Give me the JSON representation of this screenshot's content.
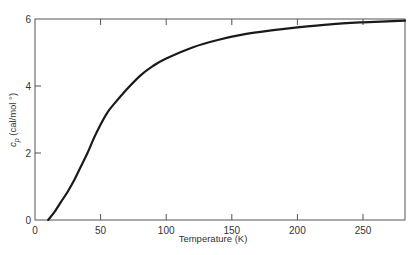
{
  "chart_data": {
    "type": "line",
    "title": "",
    "xlabel": "Temperature (K)",
    "ylabel": "c_p (cal/mol °)",
    "ylabel_main": "c",
    "ylabel_sub": "p",
    "ylabel_rest": " (cal/mol °)",
    "xlim": [
      0,
      282
    ],
    "ylim": [
      0,
      6
    ],
    "xticks": [
      0,
      50,
      100,
      150,
      200,
      250
    ],
    "yticks": [
      0,
      2,
      4,
      6
    ],
    "xtick_labels": [
      "0",
      "50",
      "100",
      "150",
      "200",
      "250"
    ],
    "ytick_labels": [
      "0",
      "2",
      "4",
      "6"
    ],
    "grid": false,
    "legend": null,
    "series": [
      {
        "name": "c_p",
        "x": [
          10,
          15,
          20,
          25,
          30,
          35,
          40,
          45,
          50,
          55,
          60,
          70,
          80,
          90,
          100,
          120,
          140,
          160,
          180,
          200,
          225,
          250,
          282
        ],
        "y": [
          0.0,
          0.25,
          0.55,
          0.85,
          1.2,
          1.6,
          2.0,
          2.45,
          2.85,
          3.2,
          3.45,
          3.9,
          4.3,
          4.6,
          4.82,
          5.15,
          5.38,
          5.55,
          5.66,
          5.75,
          5.84,
          5.9,
          5.95
        ]
      }
    ],
    "line_color": "#1a1a1a",
    "axis_color": "#555555"
  }
}
